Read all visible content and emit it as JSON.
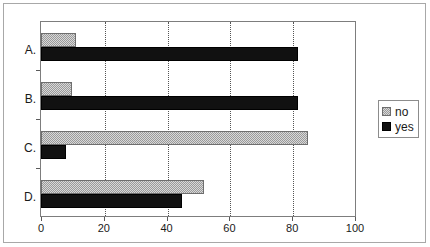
{
  "chart_data": {
    "type": "bar",
    "orientation": "horizontal",
    "title": "",
    "xlabel": "",
    "ylabel": "",
    "categories": [
      "A.",
      "B.",
      "C.",
      "D."
    ],
    "series": [
      {
        "name": "no",
        "color": "#9a9a9a",
        "values": [
          11,
          10,
          85,
          52
        ]
      },
      {
        "name": "yes",
        "color": "#111111",
        "values": [
          82,
          82,
          8,
          45
        ]
      }
    ],
    "xlim": [
      0,
      100
    ],
    "xticks": [
      0,
      20,
      40,
      60,
      80,
      100
    ],
    "xtick_labels": [
      "0",
      "20",
      "40",
      "60",
      "80",
      "100"
    ],
    "grid": "vertical-dotted",
    "legend_position": "right",
    "legend_entries": [
      "no",
      "yes"
    ]
  },
  "legend": {
    "items": [
      {
        "label": "no",
        "swatch": "gray-hatched-swatch"
      },
      {
        "label": "yes",
        "swatch": "black-swatch"
      }
    ]
  }
}
